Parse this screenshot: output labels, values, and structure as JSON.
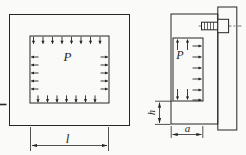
{
  "diagram": {
    "front_view": {
      "pressure_label": "P",
      "width_dim_label": "l"
    },
    "side_view": {
      "pressure_label": "P",
      "depth_dim_label": "a",
      "offset_dim_label": "h"
    },
    "colors": {
      "line": "#262626",
      "background": "#fafaf8"
    }
  }
}
